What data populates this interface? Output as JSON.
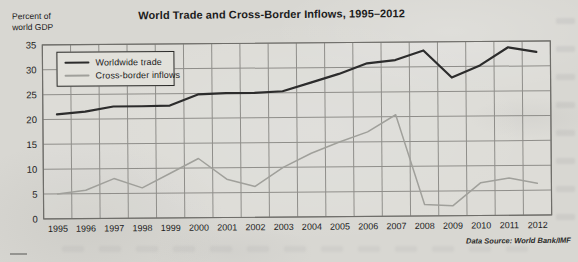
{
  "page": {
    "title": "World Trade and Cross-Border Inflows, 1995–2012",
    "y_axis_unit_label": [
      "Percent of",
      "world GDP"
    ],
    "source_note": "Data Source: World Bank/IMF"
  },
  "legend": {
    "items": [
      {
        "label": "Worldwide trade",
        "color": "#2c2c2c",
        "thickness": 2.6
      },
      {
        "label": "Cross-border inflows",
        "color": "#a0a09b",
        "thickness": 1.5
      }
    ]
  },
  "chart_data": {
    "type": "line",
    "title": "World Trade and Cross-Border Inflows, 1995–2012",
    "ylabel": "Percent of world GDP",
    "xlabel": "",
    "x": [
      "1995",
      "1996",
      "1997",
      "1998",
      "1999",
      "2000",
      "2001",
      "2002",
      "2003",
      "2004",
      "2005",
      "2006",
      "2007",
      "2008",
      "2009",
      "2010",
      "2011",
      "2012"
    ],
    "ylim": [
      0,
      35
    ],
    "ytick_step": 5,
    "grid": true,
    "legend_position": "upper left inside",
    "source": "Data Source: World Bank/IMF",
    "series": [
      {
        "name": "Worldwide trade",
        "color": "#2c2c2c",
        "stroke_width": 2.2,
        "values": [
          21,
          21.5,
          22.5,
          22.5,
          22.6,
          24.8,
          25,
          25,
          25.3,
          27,
          28.7,
          30.8,
          31.4,
          33.3,
          27.8,
          30.2,
          33.8,
          32.8
        ]
      },
      {
        "name": "Cross-border inflows",
        "color": "#a0a09b",
        "stroke_width": 1.5,
        "values": [
          5,
          5.7,
          8,
          6.1,
          9,
          11.9,
          7.7,
          6.2,
          10,
          12.8,
          15,
          17,
          20.4,
          2.3,
          2,
          6.6,
          7.5,
          6.4
        ]
      }
    ],
    "colors": {
      "grid": "#8f8e8a",
      "frame": "#6e6d69",
      "text": "#1c1c1c",
      "plot_bg_tint": "rgba(255,255,255,0.13)"
    }
  }
}
